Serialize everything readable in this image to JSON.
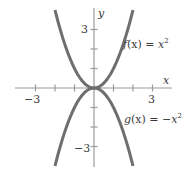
{
  "chart_data": {
    "type": "line",
    "title": "",
    "xlabel": "x",
    "ylabel": "y",
    "xlim": [
      -4,
      4
    ],
    "ylim": [
      -4,
      4
    ],
    "grid": false,
    "x_ticks": [
      -3,
      -2,
      -1,
      1,
      2,
      3
    ],
    "y_ticks": [
      -3,
      -2,
      -1,
      1,
      2,
      3
    ],
    "x_tick_labels": [
      {
        "value": -3,
        "label": "−3"
      },
      {
        "value": 3,
        "label": "3"
      }
    ],
    "y_tick_labels": [
      {
        "value": 3,
        "label": "3"
      },
      {
        "value": -3,
        "label": "−3"
      }
    ],
    "series": [
      {
        "name": "f(x) = x²",
        "label_parts": {
          "fn": "f",
          "arg": "(x) = ",
          "var": "x",
          "sup": "2"
        },
        "formula": "x^2",
        "x": [
          -2,
          -1.5,
          -1,
          -0.5,
          0,
          0.5,
          1,
          1.5,
          2
        ],
        "values": [
          4,
          2.25,
          1,
          0.25,
          0,
          0.25,
          1,
          2.25,
          4
        ],
        "color": "#6e6e6e"
      },
      {
        "name": "g(x) = −x²",
        "label_parts": {
          "fn": "g",
          "arg": "(x) = −",
          "var": "x",
          "sup": "2"
        },
        "formula": "-x^2",
        "x": [
          -2,
          -1.5,
          -1,
          -0.5,
          0,
          0.5,
          1,
          1.5,
          2
        ],
        "values": [
          -4,
          -2.25,
          -1,
          -0.25,
          0,
          -0.25,
          -1,
          -2.25,
          -4
        ],
        "color": "#6e6e6e"
      }
    ],
    "annotations": [
      {
        "text": "f(x) = x²",
        "near": [
          2,
          2
        ]
      },
      {
        "text": "g(x) = −x²",
        "near": [
          2,
          -2
        ]
      }
    ]
  }
}
